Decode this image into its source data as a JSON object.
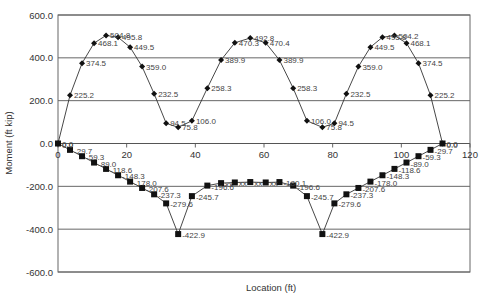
{
  "chart_data": {
    "type": "line",
    "title": "",
    "xlabel": "Location (ft)",
    "ylabel": "Moment (ft kip)",
    "xlim": [
      0,
      120
    ],
    "ylim": [
      -600,
      600
    ],
    "x_ticks": [
      0,
      20,
      40,
      60,
      80,
      100,
      120
    ],
    "y_ticks": [
      600,
      400,
      200,
      0,
      -200,
      -400,
      -600
    ],
    "y_tick_labels": [
      "600.0",
      "400.0",
      "200.0",
      "0.0",
      "-200.0",
      "-400.0",
      "-600.0"
    ],
    "grid": "horizontal",
    "legend": "none",
    "series": [
      {
        "name": "Positive moment",
        "marker": "diamond",
        "x": [
          0,
          3.5,
          7,
          10.5,
          14,
          17.5,
          21,
          24.5,
          28,
          31.5,
          35,
          39,
          43.5,
          47.5,
          51.5,
          56,
          60.5,
          64.5,
          68.5,
          72.5,
          77,
          80.5,
          84,
          87.5,
          91,
          94.5,
          98,
          101.5,
          105,
          108.5,
          112
        ],
        "values": [
          0.0,
          225.2,
          374.5,
          468.1,
          504.8,
          495.8,
          449.5,
          359.0,
          232.5,
          94.5,
          75.8,
          106.0,
          258.3,
          389.9,
          470.3,
          492.8,
          470.4,
          389.9,
          258.3,
          106.0,
          75.8,
          94.5,
          232.5,
          359.0,
          449.5,
          495.8,
          504.2,
          468.1,
          374.5,
          225.2,
          0.0
        ],
        "labels": [
          "0.0",
          "225.2",
          "374.5",
          "468.1",
          "504.8",
          "495.8",
          "449.5",
          "359.0",
          "232.5",
          "94.5",
          "75.8",
          "106.0",
          "258.3",
          "389.9",
          "470.3",
          "492.8",
          "470.4",
          "389.9",
          "258.3",
          "106.0",
          "75.8",
          "94.5",
          "232.5",
          "359.0",
          "449.5",
          "495.8",
          "504.2",
          "468.1",
          "374.5",
          "225.2",
          "0.0"
        ]
      },
      {
        "name": "Negative moment",
        "marker": "square",
        "x": [
          0,
          3.5,
          7,
          10.5,
          14,
          17.5,
          21,
          24.5,
          28,
          31.5,
          35,
          39,
          43.5,
          47.5,
          51.5,
          56,
          60.5,
          64.5,
          68.5,
          72.5,
          77,
          80.5,
          84,
          87.5,
          91,
          94.5,
          98,
          101.5,
          105,
          108.5,
          112
        ],
        "values": [
          0.0,
          -29.7,
          -59.3,
          -89.0,
          -118.6,
          -148.3,
          -178.0,
          -207.6,
          -237.3,
          -279.6,
          -422.9,
          -245.7,
          -196.6,
          -185,
          -182,
          -180,
          -182,
          -180.1,
          -196.6,
          -245.7,
          -422.9,
          -279.6,
          -237.3,
          -207.6,
          -178.0,
          -148.3,
          -118.6,
          -89.0,
          -59.3,
          -29.7,
          0.0
        ],
        "labels": [
          "0.0",
          "-29.7",
          "-59.3",
          "-89.0",
          "-118.6",
          "-148.3",
          "-178.0",
          "-207.6",
          "-237.3",
          "-279.6",
          "-422.9",
          "-245.7",
          "-196.6",
          "xx",
          "xx",
          "xx",
          "xx",
          "-180.1",
          "-196.6",
          "-245.7",
          "-422.9",
          "-279.6",
          "-237.3",
          "-207.6",
          "-178.0",
          "-148.3",
          "-118.6",
          "-89.0",
          "-59.3",
          "-29.7",
          "0.0"
        ]
      }
    ]
  },
  "colors": {
    "line": "#333333",
    "grid": "#555555",
    "frame": "#666666",
    "marker": "#111111"
  }
}
